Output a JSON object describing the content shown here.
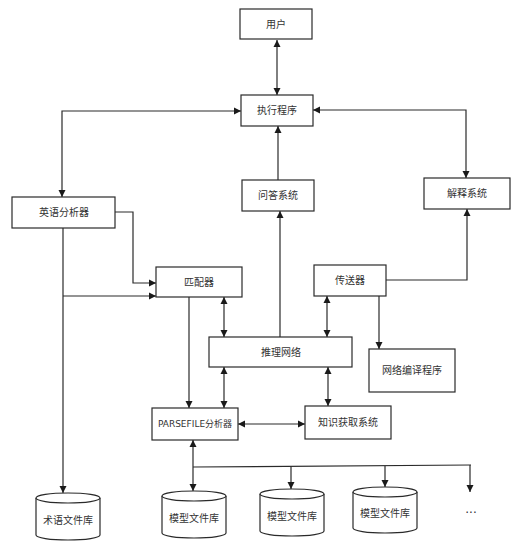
{
  "diagram": {
    "nodes": {
      "user": "用户",
      "executor": "执行程序",
      "english_analyzer": "英语分析器",
      "qa_system": "问答系统",
      "explanation_system": "解释系统",
      "matcher": "匹配器",
      "transmitter": "传送器",
      "inference_network": "推理网络",
      "network_compiler": "网络编译程序",
      "parsefile_analyzer": "PARSEFILE分析器",
      "knowledge_acquisition": "知识获取系统",
      "term_library": "术语文件库",
      "model_library_1": "模型文件库",
      "model_library_2": "模型文件库",
      "model_library_3": "模型文件库",
      "more": "..."
    },
    "edges": [
      {
        "from": "用户",
        "to": "执行程序",
        "type": "bidirectional"
      },
      {
        "from": "执行程序",
        "to": "英语分析器",
        "type": "bidirectional"
      },
      {
        "from": "执行程序",
        "to": "解释系统",
        "type": "bidirectional"
      },
      {
        "from": "问答系统",
        "to": "执行程序",
        "type": "directed"
      },
      {
        "from": "推理网络",
        "to": "问答系统",
        "type": "directed"
      },
      {
        "from": "传送器",
        "to": "解释系统",
        "type": "directed"
      },
      {
        "from": "英语分析器",
        "to": "匹配器",
        "type": "directed"
      },
      {
        "from": "英语分析器",
        "to": "匹配器",
        "type": "directed",
        "note": "branch line"
      },
      {
        "from": "英语分析器",
        "to": "术语文件库",
        "type": "directed"
      },
      {
        "from": "匹配器",
        "to": "PARSEFILE分析器",
        "type": "directed"
      },
      {
        "from": "匹配器",
        "to": "推理网络",
        "type": "bidirectional"
      },
      {
        "from": "传送器",
        "to": "推理网络",
        "type": "bidirectional"
      },
      {
        "from": "传送器",
        "to": "网络编译程序",
        "type": "directed"
      },
      {
        "from": "推理网络",
        "to": "PARSEFILE分析器",
        "type": "bidirectional"
      },
      {
        "from": "推理网络",
        "to": "知识获取系统",
        "type": "bidirectional"
      },
      {
        "from": "PARSEFILE分析器",
        "to": "知识获取系统",
        "type": "bidirectional"
      },
      {
        "from": "PARSEFILE分析器",
        "to": "模型文件库 (bus)",
        "type": "bidirectional"
      },
      {
        "from": "bus",
        "to": "模型文件库",
        "type": "directed"
      },
      {
        "from": "bus",
        "to": "模型文件库",
        "type": "directed"
      },
      {
        "from": "bus",
        "to": "...",
        "type": "directed"
      }
    ]
  }
}
